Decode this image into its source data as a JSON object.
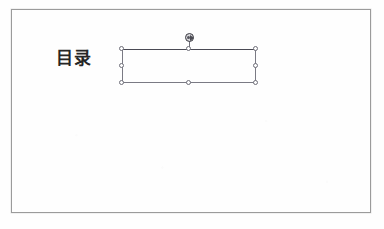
{
  "app": {
    "type": "slide-editor",
    "view": "slide-canvas"
  },
  "slide": {
    "background_color": "#fefefe",
    "border_color": "#9b9b9b",
    "title": {
      "text": "目录",
      "color": "#262626"
    },
    "selected_shape": {
      "kind": "text-placeholder",
      "content": "",
      "outline_color": "#7a7a84",
      "state": "selected",
      "handles": [
        {
          "name": "top-left",
          "position": "tl"
        },
        {
          "name": "top-middle",
          "position": "tm"
        },
        {
          "name": "top-right",
          "position": "tr"
        },
        {
          "name": "middle-left",
          "position": "ml"
        },
        {
          "name": "middle-right",
          "position": "mr"
        },
        {
          "name": "bottom-left",
          "position": "bl"
        },
        {
          "name": "bottom-middle",
          "position": "bm"
        },
        {
          "name": "bottom-right",
          "position": "br"
        }
      ],
      "rotation_handle": {
        "name": "rotate-handle",
        "color": "#3a3a42"
      }
    }
  }
}
